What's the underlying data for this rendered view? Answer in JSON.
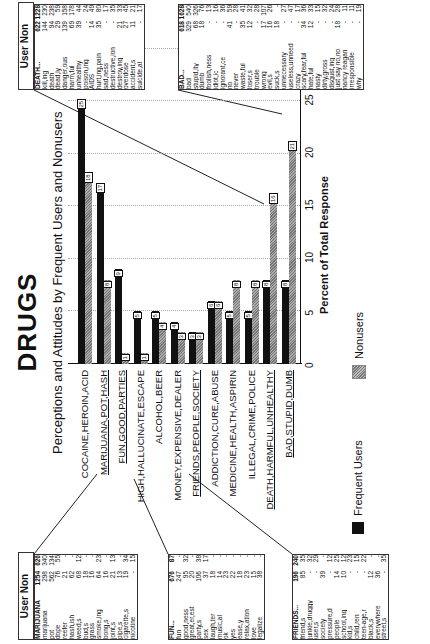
{
  "title": "DRUGS",
  "subtitle": "Perceptions and Attitudes by Frequent Users and Nonusers",
  "chart_data": {
    "type": "bar",
    "orientation": "horizontal",
    "title": "DRUGS",
    "subtitle": "Perceptions and Attitudes by Frequent Users and Nonusers",
    "xlabel": "Percent of Total Response",
    "ylabel": "",
    "xlim": [
      0,
      30
    ],
    "xticks": [
      0,
      5,
      10,
      15,
      20,
      25,
      30
    ],
    "grid": true,
    "legend_position": "bottom",
    "categories": [
      "COCAINE,HEROIN,ACID",
      "MARIJUANA,POT,HASH",
      "FUN,GOOD,PARTIES",
      "HIGH,HALLUCINATE,ESCAPE",
      "ALCOHOL,BEER",
      "MONEY,EXPENSIVE,DEALER",
      "FRIENDS,PEOPLE,SOCIETY",
      "ADDICTION,CURE,ABUSE",
      "MEDICINE,HEALTH,ASPIRIN",
      "ILLEGAL,CRIME,POLICE",
      "DEATH,HARMFUL,UNHEALTHY",
      "BAD,STUPID,DUMB"
    ],
    "series": [
      {
        "name": "Frequent Users",
        "color": "#111111",
        "values": [
          25,
          17,
          9,
          5,
          5,
          4,
          3,
          6,
          5,
          5,
          8,
          8
        ]
      },
      {
        "name": "Nonusers",
        "color": "#999999",
        "values": [
          18,
          8,
          1,
          1,
          4,
          3,
          3,
          6,
          8,
          8,
          16,
          21
        ]
      }
    ]
  },
  "axis": {
    "xlabel": "Percent of Total Response",
    "ticks": [
      "0",
      "5",
      "10",
      "15",
      "20",
      "25",
      "30"
    ]
  },
  "legend": {
    "users": "Frequent Users",
    "nonusers": "Nonusers"
  },
  "tables": {
    "header": "User Non",
    "marijuana": {
      "rows": [
        [
          "MARIJUANA",
          "1254",
          "626"
        ],
        [
          "marijuana",
          "298",
          "340"
        ],
        [
          "pot",
          "562",
          "134"
        ],
        [
          "dope",
          "76",
          "55"
        ],
        [
          "reefer",
          "21",
          "-"
        ],
        [
          "hash,ish",
          "62",
          "-"
        ],
        [
          "weed,s",
          "68",
          "12"
        ],
        [
          "bud,s",
          "18",
          "-"
        ],
        [
          "grass",
          "16",
          "-"
        ],
        [
          "smoke,ing",
          "64",
          "23"
        ],
        [
          "bong,s",
          "16",
          "-"
        ],
        [
          "joint,s",
          "21",
          "13"
        ],
        [
          "pipe,s",
          "13",
          "-"
        ],
        [
          "cigarette,s",
          "19",
          "34"
        ],
        [
          "nicotine",
          "-",
          "15"
        ]
      ]
    },
    "fun": {
      "rows": [
        [
          "FUN...",
          "676",
          "87"
        ],
        [
          "fun",
          "247",
          "-"
        ],
        [
          "good,ness",
          "95",
          "32"
        ],
        [
          "great,er,est",
          "20",
          "-"
        ],
        [
          "party,s",
          "106",
          "38"
        ],
        [
          "sex",
          "37",
          "17"
        ],
        [
          "laugh,ter",
          "18",
          "-"
        ],
        [
          "music,al",
          "14",
          "-"
        ],
        [
          "ok",
          "23",
          "-"
        ],
        [
          "yes",
          "22",
          "-"
        ],
        [
          "ease,y",
          "18",
          "-"
        ],
        [
          "relax,ation",
          "23",
          "-"
        ],
        [
          "love",
          "15",
          "-"
        ],
        [
          "legalize",
          "38",
          "-"
        ]
      ]
    },
    "friends": {
      "rows": [
        [
          "FRIENDS...",
          "196",
          "240"
        ],
        [
          "friend,s",
          "85",
          "35"
        ],
        [
          "junkie,druggy",
          "-",
          "32"
        ],
        [
          "user,s",
          "-",
          "29"
        ],
        [
          "society",
          "39",
          "-"
        ],
        [
          "pressure,d",
          "-",
          "12"
        ],
        [
          "people",
          "14",
          "25"
        ],
        [
          "school,ing",
          "10",
          "12"
        ],
        [
          "kid,s",
          "-",
          "23"
        ],
        [
          "child,ren",
          "-",
          "15"
        ],
        [
          "teen-age,r",
          "-",
          "22"
        ],
        [
          "black,s",
          "12",
          "-"
        ],
        [
          "everywhere",
          "36",
          "-"
        ],
        [
          "street,s",
          "-",
          "35"
        ]
      ]
    },
    "death": {
      "rows": [
        [
          "DEATH...",
          "622",
          "1228"
        ],
        [
          "kill,ing",
          "144",
          "230"
        ],
        [
          "death",
          "94",
          "238"
        ],
        [
          "dead,ly",
          "29",
          "59"
        ],
        [
          "danger,ous",
          "139",
          "158"
        ],
        [
          "harm,ful",
          "69",
          "178"
        ],
        [
          "unhealthy",
          "39",
          "44"
        ],
        [
          "poison,ing",
          "-",
          "24"
        ],
        [
          "AIDS",
          "14",
          "49"
        ],
        [
          "hurt,ing,pain",
          "35",
          "80"
        ],
        [
          "sad,ness",
          "-",
          "17"
        ],
        [
          "destructive,ion",
          "-",
          "35"
        ],
        [
          "destroy,ing",
          "21",
          "33"
        ],
        [
          "overdose",
          "27",
          "45"
        ],
        [
          "accident,s",
          "11",
          "21"
        ],
        [
          "suicide,al",
          "-",
          "17"
        ]
      ]
    },
    "bad": {
      "rows": [
        [
          "BAD...",
          "618",
          "1628"
        ],
        [
          "bad",
          "329",
          "540"
        ],
        [
          "stupid,ity",
          "68",
          "326"
        ],
        [
          "dumb",
          "18",
          "76"
        ],
        [
          "foolish,ness",
          "-",
          "13"
        ],
        [
          "idiot,ic",
          "-",
          "16"
        ],
        [
          "ignorant,ce",
          "-",
          "36"
        ],
        [
          "no",
          "41",
          "59"
        ],
        [
          "never",
          "-",
          "28"
        ],
        [
          "waste,ful",
          "35",
          "41"
        ],
        [
          "loser,s",
          "12",
          "32"
        ],
        [
          "trouble",
          "-",
          "28"
        ],
        [
          "wrong",
          "17",
          "107"
        ],
        [
          "evil,s",
          "16",
          "26"
        ],
        [
          "suck,s",
          "18",
          "-"
        ],
        [
          "unnecessary",
          "-",
          "27"
        ],
        [
          "useless,unneed",
          "-",
          "47"
        ],
        [
          "crazy",
          "-",
          "17"
        ],
        [
          "scary,fear,ful",
          "34",
          "36"
        ],
        [
          "hate,ful",
          "12",
          "33"
        ],
        [
          "nasty",
          "-",
          "15"
        ],
        [
          "dirty,gross",
          "-",
          "32"
        ],
        [
          "disgust,ing",
          "-",
          "24"
        ],
        [
          "just say no,no",
          "18",
          "28"
        ],
        [
          "nancy reagan",
          "-",
          "11"
        ],
        [
          "irresponsible",
          "-",
          "11"
        ],
        [
          "why",
          "-",
          "19"
        ]
      ]
    }
  }
}
